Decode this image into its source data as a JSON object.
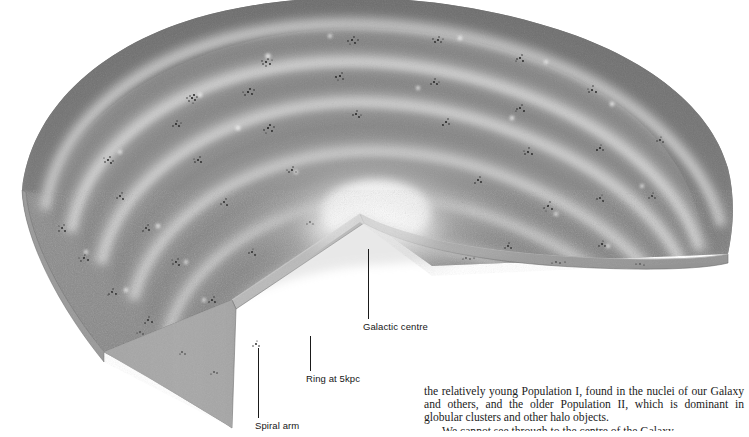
{
  "figure": {
    "colors": {
      "disc_base": "#8a8a8a",
      "arm_highlight": "#c6c6c6",
      "bulge_core": "#f2f2f2",
      "rim_shadow": "#6d6d6d",
      "cut_face": "#9b9b9b",
      "cluster_speckle": "#1a1a1a",
      "background": "#ffffff",
      "label_text": "#161616",
      "leader_line": "#1a1a1a"
    }
  },
  "labels": [
    {
      "id": "galactic-centre",
      "text": "Galactic centre"
    },
    {
      "id": "ring-at-5kpc",
      "text": "Ring at 5kpc"
    },
    {
      "id": "spiral-arm",
      "text": "Spiral arm"
    }
  ],
  "body_text": {
    "paragraph_1": "the relatively young Population I, found in the nuclei of our Galaxy and others, and the older Population II, which is dominant in globular clusters and other halo objects.",
    "paragraph_2_clipped": "We cannot see through to the centre of the Galaxy"
  }
}
